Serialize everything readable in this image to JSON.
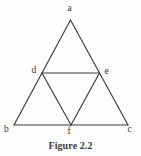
{
  "figure": {
    "caption": "Figure 2.2",
    "caption_position": {
      "x": 0,
      "y": 140
    },
    "canvas": {
      "width": 141,
      "height": 156,
      "background": "#fefefe"
    },
    "stroke": {
      "color": "#3b3b3b",
      "width": 1.15
    },
    "label_color": "#353535"
  },
  "chart_data": {
    "type": "diagram",
    "title": "Figure 2.2",
    "points": [
      {
        "id": "a",
        "label": "a",
        "x": 70.5,
        "y": 20.0,
        "role": "apex-vertex"
      },
      {
        "id": "b",
        "label": "b",
        "x": 14.0,
        "y": 125.0,
        "role": "bottom-left-vertex"
      },
      {
        "id": "c",
        "label": "c",
        "x": 128.0,
        "y": 125.0,
        "role": "bottom-right-vertex"
      },
      {
        "id": "d",
        "label": "d",
        "x": 42.0,
        "y": 73.0,
        "role": "midpoint-ab"
      },
      {
        "id": "e",
        "label": "e",
        "x": 99.5,
        "y": 73.0,
        "role": "midpoint-ac"
      },
      {
        "id": "f",
        "label": "f",
        "x": 71.0,
        "y": 125.0,
        "role": "midpoint-bc"
      }
    ],
    "edges": [
      {
        "from": "a",
        "to": "b",
        "kind": "outer-side"
      },
      {
        "from": "a",
        "to": "c",
        "kind": "outer-side"
      },
      {
        "from": "b",
        "to": "c",
        "kind": "outer-base"
      },
      {
        "from": "d",
        "to": "e",
        "kind": "midsegment"
      },
      {
        "from": "d",
        "to": "f",
        "kind": "midsegment"
      },
      {
        "from": "e",
        "to": "f",
        "kind": "midsegment"
      }
    ],
    "sub_triangles": [
      {
        "vertices": [
          "a",
          "d",
          "e"
        ]
      },
      {
        "vertices": [
          "d",
          "b",
          "f"
        ]
      },
      {
        "vertices": [
          "e",
          "f",
          "c"
        ]
      },
      {
        "vertices": [
          "d",
          "e",
          "f"
        ]
      }
    ]
  },
  "labels": {
    "a": {
      "text": "a",
      "x": 67.5,
      "y": 4.0
    },
    "b": {
      "text": "b",
      "x": 4.0,
      "y": 124.5
    },
    "c": {
      "text": "c",
      "x": 127.5,
      "y": 125.0
    },
    "d": {
      "text": "d",
      "x": 31.5,
      "y": 65.5
    },
    "e": {
      "text": "e",
      "x": 104.5,
      "y": 66.5
    },
    "f": {
      "text": "f",
      "x": 67.5,
      "y": 126.5
    }
  }
}
